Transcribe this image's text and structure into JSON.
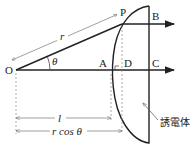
{
  "diagram": {
    "labels": {
      "O": "O",
      "P": "P",
      "A": "A",
      "B": "B",
      "C": "C",
      "D": "D",
      "r": "r",
      "theta": "θ",
      "l": "l",
      "r_cos_theta": "r cos θ",
      "dielectric": "誘電体"
    },
    "colors": {
      "line": "#222222",
      "dim_line": "#777777",
      "background": "#ffffff"
    }
  }
}
